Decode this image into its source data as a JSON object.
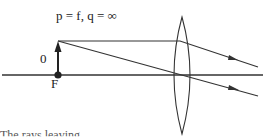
{
  "diagram": {
    "title_equation": "p = f,     q = ∞",
    "object_label": "0",
    "focal_point_label": "F",
    "caption_partial": "The rays leaving"
  },
  "colors": {
    "line": "#333333",
    "background": "#ffffff"
  }
}
